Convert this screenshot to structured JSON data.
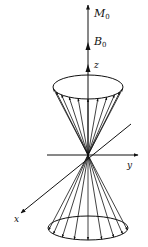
{
  "figure": {
    "type": "double cone of magnetic moment vectors (spin precession diagram)",
    "labels": {
      "m0": "M",
      "m0_sub": "0",
      "b0": "B",
      "b0_sub": "0",
      "z": "z",
      "y": "y",
      "x": "x"
    },
    "colors": {
      "stroke": "#111111",
      "background": "#ffffff"
    },
    "geometry": {
      "origin": [
        88,
        155
      ],
      "z_axis_top": [
        88,
        4
      ],
      "upper_ellipse": {
        "cx": 88,
        "cy": 87,
        "rx": 35,
        "ry": 12
      },
      "lower_ellipse": {
        "cx": 88,
        "cy": 228,
        "rx": 40,
        "ry": 12
      },
      "y_axis": {
        "from": [
          47,
          155
        ],
        "to": [
          138,
          155
        ]
      },
      "x_axis": {
        "from": [
          131,
          124
        ],
        "to": [
          21,
          213
        ]
      },
      "upper_vector_count": 11,
      "lower_vector_count": 9
    }
  }
}
